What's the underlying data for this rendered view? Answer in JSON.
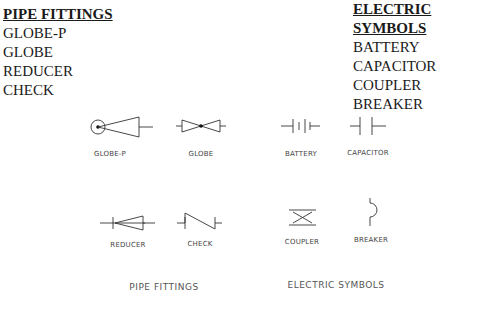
{
  "pipe_legend": {
    "heading": "PIPE FITTINGS",
    "items": [
      "GLOBE-P",
      "GLOBE",
      "REDUCER",
      "CHECK"
    ]
  },
  "electric_legend": {
    "heading": "ELECTRIC SYMBOLS",
    "items": [
      "BATTERY",
      "CAPACITOR",
      "COUPLER",
      "BREAKER"
    ]
  },
  "symbols": {
    "globe_p": {
      "label": "GLOBE-P",
      "icon": "globe-p-valve-icon"
    },
    "globe": {
      "label": "GLOBE",
      "icon": "globe-valve-icon"
    },
    "battery": {
      "label": "BATTERY",
      "icon": "battery-icon"
    },
    "capacitor": {
      "label": "CAPACITOR",
      "icon": "capacitor-icon"
    },
    "reducer": {
      "label": "REDUCER",
      "icon": "reducer-icon"
    },
    "check": {
      "label": "CHECK",
      "icon": "check-valve-icon"
    },
    "coupler": {
      "label": "COUPLER",
      "icon": "coupler-icon"
    },
    "breaker": {
      "label": "BREAKER",
      "icon": "breaker-icon"
    }
  },
  "captions": {
    "pipe": "PIPE FITTINGS",
    "electric": "ELECTRIC SYMBOLS"
  },
  "colors": {
    "line": "#333333",
    "text": "#1a1a1a",
    "label": "#444444"
  }
}
